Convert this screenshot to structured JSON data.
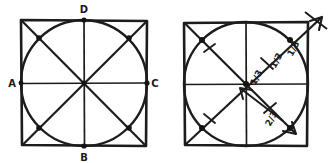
{
  "figure": {
    "ink_color": "#1c1c1c",
    "background_color": "#ffffff"
  },
  "left_diagram": {
    "name": "square-with-inscribed-circle-labeled",
    "square": {
      "x": 21,
      "y": 20,
      "width": 126,
      "height": 126
    },
    "circle": {
      "cx": 84,
      "cy": 83,
      "r": 63
    },
    "vertex_labels": [
      {
        "id": "A",
        "text": "A",
        "x": 12,
        "y": 86
      },
      {
        "id": "B",
        "text": "B",
        "x": 81,
        "y": 160
      },
      {
        "id": "C",
        "text": "C",
        "x": 152,
        "y": 86
      },
      {
        "id": "D",
        "text": "D",
        "x": 81,
        "y": 12
      }
    ],
    "node_dots": [
      {
        "x": 84,
        "y": 20
      },
      {
        "x": 84,
        "y": 146
      },
      {
        "x": 21,
        "y": 83
      },
      {
        "x": 147,
        "y": 83
      },
      {
        "x": 39,
        "y": 38
      },
      {
        "x": 129,
        "y": 38
      },
      {
        "x": 39,
        "y": 128
      },
      {
        "x": 129,
        "y": 128
      },
      {
        "x": 84,
        "y": 83
      }
    ]
  },
  "right_diagram": {
    "name": "square-with-inscribed-circle-fractions",
    "square": {
      "x": 184,
      "y": 22,
      "width": 124,
      "height": 124
    },
    "circle": {
      "cx": 246,
      "cy": 84,
      "r": 62
    },
    "fraction_labels": [
      {
        "id": "upper-outer",
        "text": "1/3",
        "x": 294,
        "y": 48,
        "rotate": -62
      },
      {
        "id": "upper-mid",
        "text": "1/3",
        "x": 277,
        "y": 60,
        "rotate": -62
      },
      {
        "id": "upper-inner",
        "text": "1/3",
        "x": 258,
        "y": 76,
        "rotate": -62
      },
      {
        "id": "lower",
        "text": "2/3",
        "x": 272,
        "y": 120,
        "rotate": -62
      }
    ],
    "tick_marks": [
      {
        "x": 209,
        "y": 48
      },
      {
        "x": 209,
        "y": 118
      },
      {
        "x": 267,
        "y": 63
      },
      {
        "x": 270,
        "y": 108
      }
    ],
    "arrows": [
      {
        "id": "arrow-to-upper-right-outside",
        "from": [
          246,
          84
        ],
        "to": [
          322,
          18
        ]
      },
      {
        "id": "arrow-to-center",
        "from": [
          280,
          118
        ],
        "to": [
          241,
          89
        ]
      },
      {
        "id": "arrow-to-lower-right",
        "from": [
          246,
          84
        ],
        "to": [
          290,
          128
        ]
      }
    ],
    "node_dots": [
      {
        "x": 246,
        "y": 84
      },
      {
        "x": 202,
        "y": 40
      },
      {
        "x": 290,
        "y": 40
      },
      {
        "x": 202,
        "y": 128
      },
      {
        "x": 290,
        "y": 128
      }
    ]
  }
}
